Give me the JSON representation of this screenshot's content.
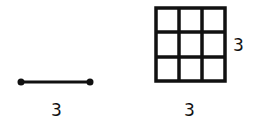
{
  "diagram": {
    "segment": {
      "length_label": "3",
      "color": "#111111"
    },
    "grid": {
      "rows": 3,
      "cols": 3,
      "width_label": "3",
      "height_label": "3",
      "color": "#111111"
    }
  }
}
